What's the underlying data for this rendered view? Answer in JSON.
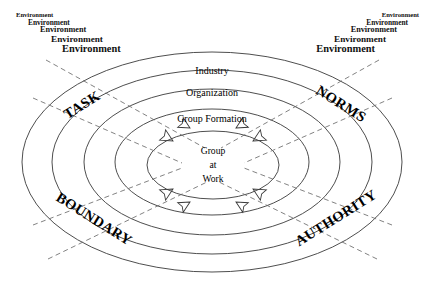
{
  "diagram": {
    "background_color": "#ffffff",
    "line_color": "#3a3a3a",
    "dash_color": "#6b6b6b",
    "text_color": "#000000",
    "environment": {
      "label": "Environment",
      "left_lines": [
        "Environment",
        "Environment",
        "Environment",
        "Environment",
        "Environment"
      ],
      "right_lines": [
        "Environment",
        "Environment",
        "Environment",
        "Environment",
        "Environment"
      ]
    },
    "rings": [
      {
        "label": "Industry",
        "x": 212,
        "y": 70
      },
      {
        "label": "Organization",
        "x": 212,
        "y": 92
      },
      {
        "label": "Group Formation",
        "x": 212,
        "y": 118
      }
    ],
    "core": {
      "lines": [
        "Group",
        "at",
        "Work"
      ],
      "x": 213,
      "y": 165
    },
    "axes": [
      {
        "label": "TASK",
        "x": 82,
        "y": 105,
        "rotation": -32
      },
      {
        "label": "NORMS",
        "x": 341,
        "y": 104,
        "rotation": 32
      },
      {
        "label": "BOUNDARY",
        "x": 94,
        "y": 219,
        "rotation": 32
      },
      {
        "label": "AUTHORITY",
        "x": 336,
        "y": 218,
        "rotation": -32
      }
    ],
    "arrows": {
      "count": 4,
      "direction": "inward",
      "style": "open-outline-dashed"
    }
  }
}
